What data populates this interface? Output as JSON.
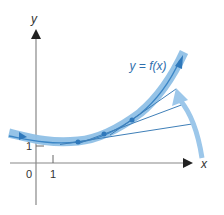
{
  "figure": {
    "axes": {
      "x_label": "x",
      "y_label": "y",
      "origin_label": "0",
      "x_tick_label": "1",
      "y_tick_label": "1"
    },
    "curve": {
      "label": "y = f(x)"
    },
    "tangent_count": 3,
    "colors": {
      "curve_band": "#8fc0e6",
      "curve_line": "#3b86c6",
      "tangent": "#3f7fb8",
      "axis": "#777777",
      "text": "#333333",
      "rotation_arrow": "#9cc7ea"
    }
  }
}
